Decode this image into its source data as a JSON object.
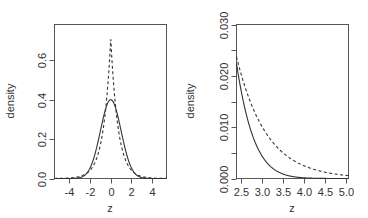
{
  "chart_data": [
    {
      "type": "line",
      "title": "",
      "xlabel": "z",
      "ylabel": "density",
      "xlim": [
        -5.45,
        5.4
      ],
      "ylim": [
        0,
        0.78
      ],
      "xticks": [
        -4,
        -2,
        0,
        2,
        4
      ],
      "xtick_labels": [
        "-4",
        "-2",
        "0",
        "2",
        "4"
      ],
      "yticks": [
        0.0,
        0.2,
        0.4,
        0.6
      ],
      "ytick_labels": [
        "0.0",
        "0.2",
        "0.4",
        "0.6"
      ],
      "grid": false,
      "legend": null,
      "series": [
        {
          "name": "normal",
          "style": "solid",
          "x_range": [
            -5.45,
            5.4
          ],
          "peak": 0.399,
          "x": [
            -4,
            -3,
            -2,
            -1,
            0,
            1,
            2,
            3,
            4
          ],
          "y": [
            0.0001,
            0.0044,
            0.054,
            0.242,
            0.399,
            0.242,
            0.054,
            0.0044,
            0.0001
          ]
        },
        {
          "name": "laplace",
          "style": "dashed",
          "x_range": [
            -5.45,
            5.4
          ],
          "peak": 0.707,
          "x": [
            -4,
            -3,
            -2,
            -1,
            0,
            1,
            2,
            3,
            4
          ],
          "y": [
            0.0025,
            0.01,
            0.042,
            0.172,
            0.707,
            0.172,
            0.042,
            0.01,
            0.0025
          ]
        }
      ]
    },
    {
      "type": "line",
      "title": "",
      "xlabel": "z",
      "ylabel": "density",
      "xlim": [
        2.4,
        5.05
      ],
      "ylim": [
        0,
        0.03
      ],
      "xticks": [
        2.5,
        3.0,
        3.5,
        4.0,
        4.5,
        5.0
      ],
      "xtick_labels": [
        "2.5",
        "3.0",
        "3.5",
        "4.0",
        "4.5",
        "5.0"
      ],
      "yticks": [
        0.0,
        0.005,
        0.01,
        0.015,
        0.02,
        0.025,
        0.03
      ],
      "ytick_labels": [
        "0.000",
        "",
        "0.010",
        "",
        "0.020",
        "",
        "0.030"
      ],
      "grid": false,
      "legend": null,
      "series": [
        {
          "name": "normal",
          "style": "solid",
          "x": [
            2.4,
            2.5,
            3.0,
            3.5,
            4.0,
            4.5,
            5.0
          ],
          "y": [
            0.0224,
            0.0175,
            0.0044,
            0.0009,
            0.0001,
            0.0,
            0.0
          ]
        },
        {
          "name": "laplace",
          "style": "dashed",
          "x": [
            2.4,
            2.5,
            3.0,
            3.5,
            4.0,
            4.5,
            5.0
          ],
          "y": [
            0.0237,
            0.0206,
            0.0102,
            0.005,
            0.0025,
            0.0012,
            0.0006
          ]
        }
      ]
    }
  ],
  "panels": [
    {
      "ylabel": "density",
      "xlabel": "z"
    },
    {
      "ylabel": "density",
      "xlabel": "z"
    }
  ]
}
